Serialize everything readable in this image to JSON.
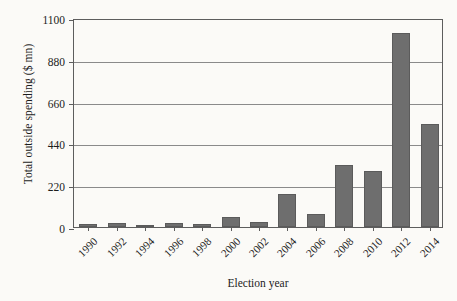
{
  "chart_data": {
    "type": "bar",
    "title": "",
    "xlabel": "Election year",
    "ylabel": "Total outside spending ($ mn)",
    "categories": [
      "1990",
      "1992",
      "1994",
      "1996",
      "1998",
      "2000",
      "2002",
      "2004",
      "2006",
      "2008",
      "2010",
      "2012",
      "2014"
    ],
    "values": [
      14,
      20,
      13,
      21,
      18,
      51,
      26,
      172,
      67,
      325,
      297,
      1021,
      540
    ],
    "ylim": [
      0,
      1100
    ],
    "yticks": [
      0,
      220,
      440,
      660,
      880,
      1100
    ],
    "ytick_labels": [
      "0",
      "220",
      "440",
      "660",
      "880",
      "1100"
    ],
    "grid": "horizontal",
    "legend": "none",
    "bar_color": "#6e6e6e",
    "axis_color": "#5d5d5d",
    "gridline_color": "#8a8a8a",
    "background_color": "#fbfaf7",
    "xtick_rotation": -45
  }
}
